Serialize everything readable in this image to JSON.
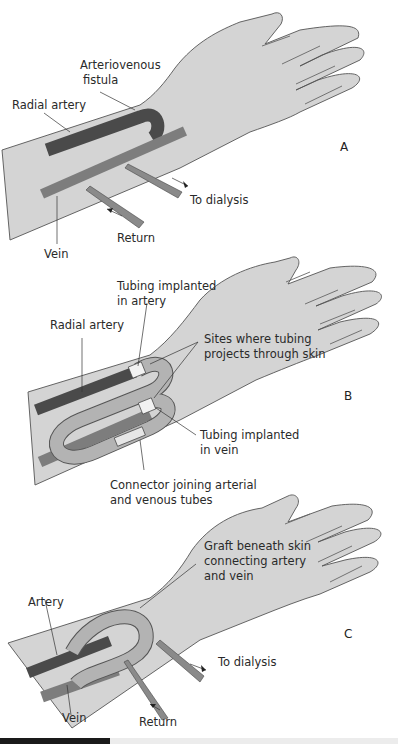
{
  "figure": {
    "panels": [
      {
        "id": "A",
        "label": "A",
        "labels": {
          "fistula": [
            "Arteriovenous",
            "fistula"
          ],
          "radial_artery": "Radial artery",
          "to_dialysis": "To dialysis",
          "return": "Return",
          "vein": "Vein"
        }
      },
      {
        "id": "B",
        "label": "B",
        "labels": {
          "tubing_artery": [
            "Tubing implanted",
            "in artery"
          ],
          "radial_artery": "Radial artery",
          "sites": [
            "Sites where tubing",
            "projects through skin"
          ],
          "tubing_vein": [
            "Tubing implanted",
            "in vein"
          ],
          "connector": [
            "Connector joining arterial",
            "and venous tubes"
          ]
        }
      },
      {
        "id": "C",
        "label": "C",
        "labels": {
          "graft": [
            "Graft beneath skin",
            "connecting artery",
            "and vein"
          ],
          "artery": "Artery",
          "to_dialysis": "To dialysis",
          "vein": "Vein",
          "return": "Return"
        }
      }
    ],
    "colors": {
      "skin": "#d4d4d4",
      "artery": "#4a4a4a",
      "vein": "#7d7d7d",
      "graft": "#b3b3b3",
      "outline": "#555555"
    }
  }
}
